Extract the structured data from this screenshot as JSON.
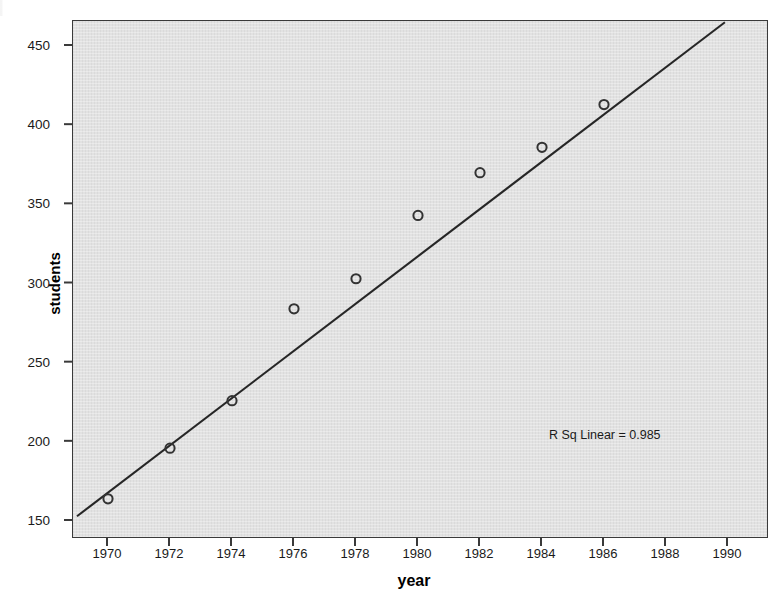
{
  "chart_data": {
    "type": "scatter",
    "title": "",
    "xlabel": "year",
    "ylabel": "students",
    "x": [
      1970,
      1972,
      1974,
      1976,
      1978,
      1980,
      1982,
      1984,
      1986
    ],
    "values": [
      164,
      196,
      226,
      284,
      303,
      343,
      370,
      386,
      413
    ],
    "series": [
      {
        "name": "students",
        "values": [
          164,
          196,
          226,
          284,
          303,
          343,
          370,
          386,
          413
        ]
      }
    ],
    "xlim": [
      1969,
      1991
    ],
    "ylim": [
      140,
      465
    ],
    "xticks": [
      "1970",
      "1972",
      "1974",
      "1976",
      "1978",
      "1980",
      "1982",
      "1984",
      "1986",
      "1988",
      "1990"
    ],
    "xtick_values": [
      1970,
      1972,
      1974,
      1976,
      1978,
      1980,
      1982,
      1984,
      1986,
      1988,
      1990
    ],
    "yticks": [
      "150",
      "200",
      "250",
      "300",
      "350",
      "400",
      "450"
    ],
    "ytick_values": [
      150,
      200,
      250,
      300,
      350,
      400,
      450
    ],
    "grid": false,
    "legend": "none",
    "annotations": [
      {
        "text": "R Sq Linear = 0.985",
        "x": 1988,
        "y": 192
      }
    ],
    "fit_line": {
      "type": "linear",
      "r_squared": 0.985,
      "label": "R Sq Linear = 0.985",
      "endpoints": [
        {
          "x": 1969,
          "y": 153
        },
        {
          "x": 1989.9,
          "y": 465
        }
      ]
    },
    "colors": {
      "panel_background": "#e2e2e2",
      "frame": "#3a3a3a",
      "marker": "#333333",
      "fit_line": "#262626",
      "text": "#1a1a1a",
      "page_background": "#ffffff"
    },
    "marker_style": "open-circle"
  },
  "axes": {
    "y_title": "students",
    "x_title": "year"
  },
  "annotation": {
    "rsq_text": "R Sq Linear = 0.985"
  }
}
